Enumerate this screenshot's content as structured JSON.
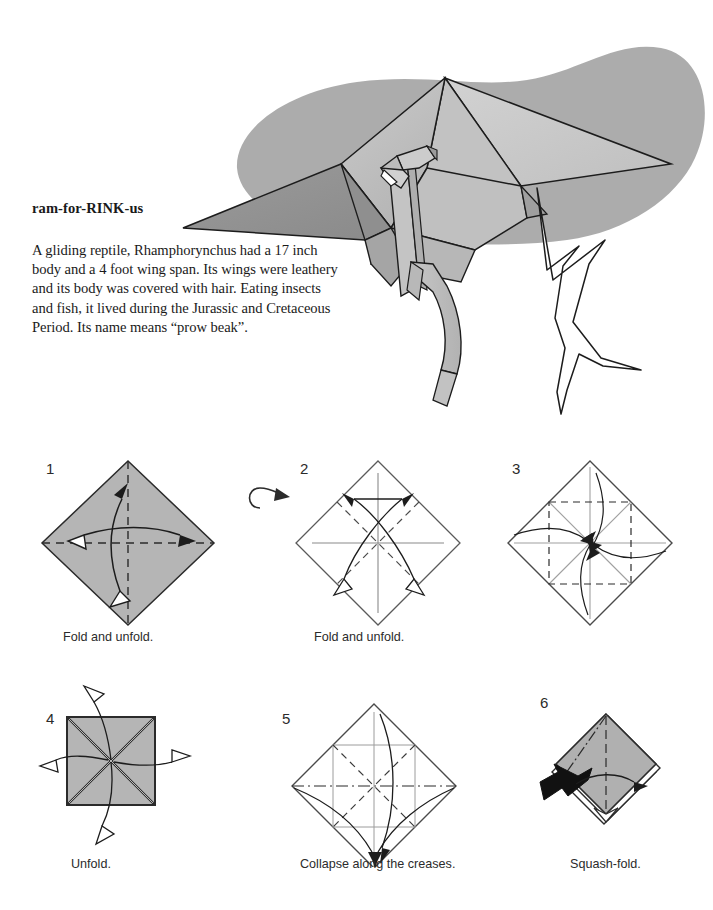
{
  "page": {
    "background_color": "#ffffff"
  },
  "model": {
    "name": "Rhamphorynchus",
    "pronunciation": "ram-for-RINK-us",
    "description": "A gliding reptile, Rhamphorynchus had a 17 inch body and a 4 foot wing span. Its wings were leathery and its body was covered with hair. Eating insects and fish, it lived during the Jurassic and Cretaceous Period. Its name means “prow beak”.",
    "illustration_name": "folded-pterosaur-model",
    "colors": {
      "paper_light": "#c9c9c9",
      "paper_mid": "#b0b0b0",
      "paper_dark": "#8e8e8e",
      "paper_white": "#ffffff",
      "shadow_blob": "#a8a8a8",
      "outline": "#1c1c1c"
    }
  },
  "symbols": {
    "turnover": {
      "name": "turn-over-symbol",
      "meaning": "Turn the paper over"
    }
  },
  "steps": [
    {
      "number": "1",
      "caption": "Fold and unfold.",
      "figure": "diamond-gray-cross-creases",
      "fill": "#b5b5b5"
    },
    {
      "number": "2",
      "caption": "Fold and unfold.",
      "figure": "diamond-white-diagonal-creases",
      "fill": "#ffffff"
    },
    {
      "number": "3",
      "caption": "",
      "figure": "diamond-white-corners-to-center",
      "fill": "#ffffff"
    },
    {
      "number": "4",
      "caption": "Unfold.",
      "figure": "square-gray-unfold-arrows",
      "fill": "#b5b5b5"
    },
    {
      "number": "5",
      "caption": "Collapse along the creases.",
      "figure": "diamond-white-collapse",
      "fill": "#ffffff"
    },
    {
      "number": "6",
      "caption": "Squash-fold.",
      "figure": "diamond-gray-squash",
      "fill": "#b0b0b0"
    }
  ]
}
